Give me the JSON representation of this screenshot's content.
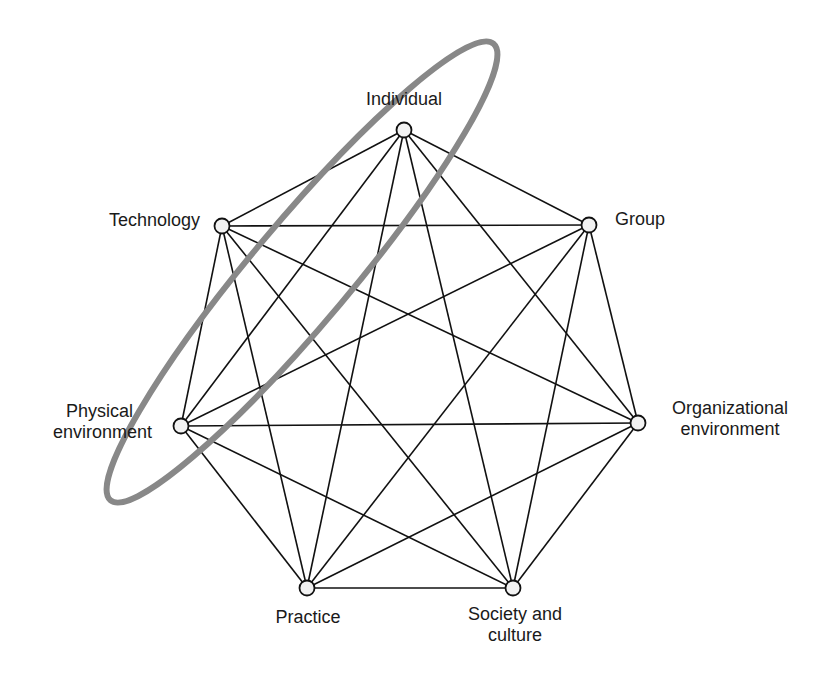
{
  "diagram": {
    "title": "",
    "colors": {
      "edge": "#111111",
      "node_fill": "#f2f2f2",
      "node_stroke": "#111111",
      "ellipse": "#888888",
      "text": "#1a1a1a"
    },
    "nodes": [
      {
        "id": "individual",
        "label": "Individual",
        "x": 404,
        "y": 130
      },
      {
        "id": "group",
        "label": "Group",
        "x": 589,
        "y": 225
      },
      {
        "id": "organizational",
        "label_line1": "Organizational",
        "label_line2": "environment",
        "x": 638,
        "y": 423
      },
      {
        "id": "society",
        "label_line1": "Society and",
        "label_line2": "culture",
        "x": 513,
        "y": 588
      },
      {
        "id": "practice",
        "label": "Practice",
        "x": 307,
        "y": 588
      },
      {
        "id": "physical",
        "label_line1": "Physical",
        "label_line2": "environment",
        "x": 181,
        "y": 426
      },
      {
        "id": "technology",
        "label": "Technology",
        "x": 222,
        "y": 226
      }
    ],
    "edges": "complete graph: every node connected to every other node (21 edges)",
    "highlight": {
      "shape": "ellipse",
      "encloses": [
        "Individual",
        "Technology",
        "Physical environment"
      ],
      "cx": 302,
      "cy": 272,
      "rx": 298,
      "ry": 50,
      "rotation_deg": -50
    }
  }
}
